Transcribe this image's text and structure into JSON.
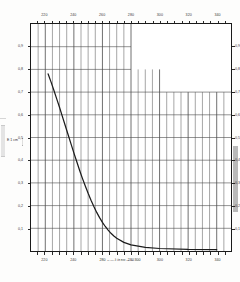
{
  "chart_data": {
    "type": "line",
    "title": "",
    "xlabel": "λ in nm",
    "ylabel": "E 1 cm",
    "xlim": [
      210,
      350
    ],
    "ylim": [
      0.0,
      1.0
    ],
    "grid": true,
    "legend": "none",
    "x_ticks_major": [
      220,
      240,
      260,
      280,
      300,
      320,
      340
    ],
    "x_tick_labels": [
      "220",
      "240",
      "260",
      "280",
      "300",
      "320",
      "340"
    ],
    "x_minor_step": 5,
    "y_ticks_major": [
      0.1,
      0.2,
      0.3,
      0.4,
      0.5,
      0.6,
      0.7,
      0.8,
      0.9
    ],
    "y_tick_labels": [
      "0,1",
      "0,2",
      "0,3",
      "0,4",
      "0,5",
      "0,6",
      "0,7",
      "0,8",
      "0,9"
    ],
    "x_axis_caption_left": "280",
    "x_axis_caption_mid": "λ in nm",
    "x_axis_caption_right": "300",
    "series": [
      {
        "name": "extinction",
        "x": [
          222,
          224,
          226,
          228,
          230,
          232,
          234,
          236,
          238,
          240,
          242,
          244,
          246,
          248,
          250,
          252,
          254,
          256,
          258,
          260,
          262,
          264,
          266,
          268,
          270,
          275,
          280,
          290,
          300,
          320,
          340
        ],
        "y": [
          0.78,
          0.745,
          0.708,
          0.67,
          0.632,
          0.592,
          0.552,
          0.512,
          0.472,
          0.432,
          0.394,
          0.356,
          0.32,
          0.286,
          0.254,
          0.224,
          0.196,
          0.17,
          0.147,
          0.126,
          0.108,
          0.092,
          0.078,
          0.066,
          0.056,
          0.038,
          0.027,
          0.016,
          0.011,
          0.007,
          0.006
        ]
      }
    ],
    "grid_fade_note": "upper-right grid region not printed"
  },
  "axes": {
    "x_top_labels": [
      "220",
      "240",
      "260",
      "280",
      "300",
      "320",
      "340"
    ],
    "x_bottom_labels": [
      "220",
      "240",
      "280",
      "300",
      "320",
      "340"
    ],
    "y_left_labels": [
      "0,9",
      "0,8",
      "0,7",
      "0,6",
      "0,5",
      "0,4",
      "0,3",
      "0,2",
      "0,1"
    ],
    "y_right_labels": [
      "0,9",
      "0,8",
      "0,7",
      "0,6",
      "0,5",
      "0,4",
      "0,3",
      "0,2",
      "0,1"
    ],
    "y_caption_main": "E 1 cm",
    "x_caption_left": "280",
    "x_caption_symbol": "λ in nm",
    "x_caption_right": "300"
  },
  "colors": {
    "frame": "#1a1a1a",
    "grid": "#4a4a4a",
    "curve": "#1c1c1c",
    "paper": "#fdfdfc",
    "scan_bar": "#b9b9b9"
  }
}
